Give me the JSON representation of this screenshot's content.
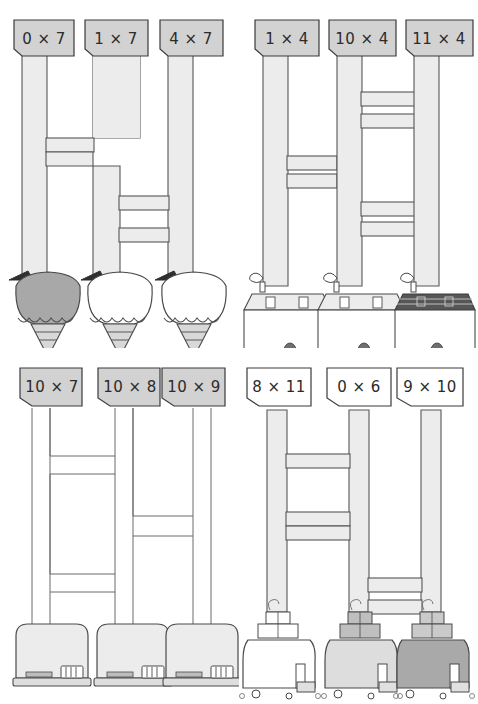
{
  "page": {
    "background_color": "#ffffff",
    "width": 478,
    "height": 704
  },
  "colors": {
    "pipe_fill": "#ececec",
    "pipe_stroke": "#55565a",
    "label_fill_gray": "#d2d2d2",
    "label_fill_white": "#ffffff",
    "label_stroke": "#3a3a3a",
    "text": "#2b2b2b",
    "object_light": "#ffffff",
    "object_mid": "#e8e8e8",
    "object_dark": "#a8a8a8",
    "object_darker": "#8f8f8f",
    "outline": "#4a4a4a"
  },
  "quadrants": [
    {
      "id": "top-left",
      "object_kind": "ice-cream-cone",
      "label_style": "gray",
      "labels": [
        {
          "text": "0 × 7",
          "operand_a": 0,
          "operand_b": 7,
          "product": 0
        },
        {
          "text": "1 × 7",
          "operand_a": 1,
          "operand_b": 7,
          "product": 7
        },
        {
          "text": "4 × 7",
          "operand_a": 4,
          "operand_b": 7,
          "product": 28
        }
      ],
      "objects": [
        {
          "kind": "ice-cream-cone",
          "shade": "dark"
        },
        {
          "kind": "ice-cream-cone",
          "shade": "light"
        },
        {
          "kind": "ice-cream-cone",
          "shade": "light"
        }
      ]
    },
    {
      "id": "top-right",
      "object_kind": "house",
      "label_style": "gray",
      "labels": [
        {
          "text": "1 × 4",
          "operand_a": 1,
          "operand_b": 4,
          "product": 4
        },
        {
          "text": "10 × 4",
          "operand_a": 10,
          "operand_b": 4,
          "product": 40
        },
        {
          "text": "11 × 4",
          "operand_a": 11,
          "operand_b": 4,
          "product": 44
        }
      ],
      "objects": [
        {
          "kind": "house",
          "shade": "light"
        },
        {
          "kind": "house",
          "shade": "light"
        },
        {
          "kind": "house",
          "shade": "dark"
        }
      ]
    },
    {
      "id": "bottom-left",
      "object_kind": "toaster",
      "label_style": "gray",
      "labels": [
        {
          "text": "10 × 7",
          "operand_a": 10,
          "operand_b": 7,
          "product": 70
        },
        {
          "text": "10 × 8",
          "operand_a": 10,
          "operand_b": 8,
          "product": 80
        },
        {
          "text": "10 × 9",
          "operand_a": 10,
          "operand_b": 9,
          "product": 90
        }
      ],
      "objects": [
        {
          "kind": "toaster",
          "shade": "light"
        },
        {
          "kind": "toaster",
          "shade": "light"
        },
        {
          "kind": "toaster",
          "shade": "light"
        }
      ]
    },
    {
      "id": "bottom-right",
      "object_kind": "gift-truck",
      "label_style": "white",
      "labels": [
        {
          "text": "8 × 11",
          "operand_a": 8,
          "operand_b": 11,
          "product": 88
        },
        {
          "text": "0 × 6",
          "operand_a": 0,
          "operand_b": 6,
          "product": 0
        },
        {
          "text": "9 × 10",
          "operand_a": 9,
          "operand_b": 10,
          "product": 90
        }
      ],
      "objects": [
        {
          "kind": "gift-truck",
          "shade": "light"
        },
        {
          "kind": "gift-truck",
          "shade": "mid"
        },
        {
          "kind": "gift-truck",
          "shade": "dark"
        }
      ]
    }
  ]
}
